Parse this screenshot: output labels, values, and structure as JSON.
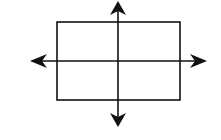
{
  "diagram": {
    "stroke_color": "#111111",
    "background": "#ffffff",
    "rectangle": {
      "x": 57,
      "y": 22,
      "width": 123,
      "height": 78
    },
    "lines_of_symmetry": [
      {
        "name": "vertical",
        "x1": 118,
        "y1": 4,
        "x2": 118,
        "y2": 126
      },
      {
        "name": "horizontal",
        "x1": 32,
        "y1": 61,
        "x2": 205,
        "y2": 61
      }
    ]
  }
}
